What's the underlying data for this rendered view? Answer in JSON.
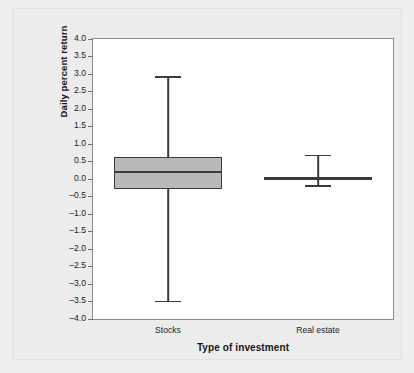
{
  "chart_data": {
    "type": "box",
    "title": "",
    "xlabel": "Type of investment",
    "ylabel": "Daily percent return",
    "ylim": [
      -4.0,
      4.0
    ],
    "grid": false,
    "legend": "none",
    "categories": [
      "Stocks",
      "Real estate"
    ],
    "ytick_labels": [
      "4.0",
      "3.5",
      "3.0",
      "2.5",
      "2.0",
      "1.5",
      "1.0",
      "0.5",
      "0.0",
      "–0.5",
      "–1.0",
      "–1.5",
      "–2.0",
      "–2.5",
      "–3.0",
      "–3.5",
      "–4.0"
    ],
    "ytick_values": [
      4.0,
      3.5,
      3.0,
      2.5,
      2.0,
      1.5,
      1.0,
      0.5,
      0.0,
      -0.5,
      -1.0,
      -1.5,
      -2.0,
      -2.5,
      -3.0,
      -3.5,
      -4.0
    ],
    "boxes": [
      {
        "name": "Stocks",
        "whisker_low": -3.48,
        "q1": -0.28,
        "median": 0.22,
        "q3": 0.62,
        "whisker_high": 2.93,
        "fill_color": "#b9b9b9",
        "line_color": "#3c3c3c"
      },
      {
        "name": "Real estate",
        "whisker_low": -0.17,
        "q1": -0.02,
        "median": 0.02,
        "q3": 0.06,
        "whisker_high": 0.7,
        "fill_color": "#3a3a3a",
        "line_color": "#3a3a3a"
      }
    ]
  },
  "style": {
    "page_background": "#efefef",
    "panel_background": "#ececed",
    "plot_background": "#ffffff",
    "frame_color": "#8b8b8b",
    "text_color": "#1c1c1c"
  }
}
